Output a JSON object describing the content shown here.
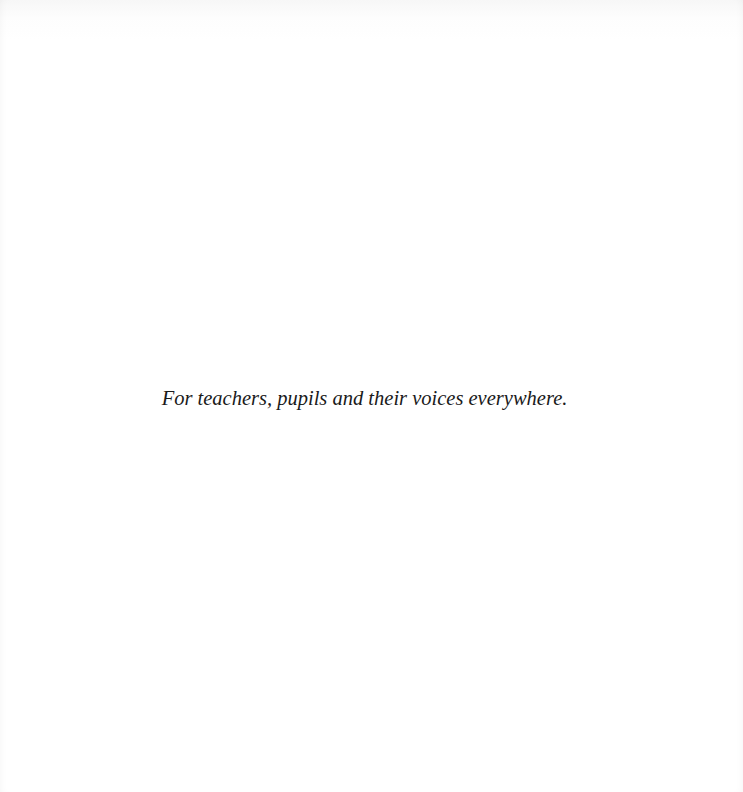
{
  "page": {
    "dedication": "For teachers, pupils and their voices everywhere."
  }
}
